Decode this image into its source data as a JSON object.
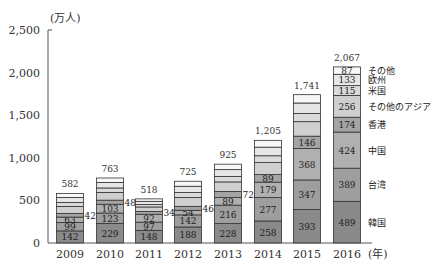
{
  "chart_data": {
    "type": "bar",
    "stacked": true,
    "title": "",
    "ylabel": "(万人)",
    "xlabel": "(年)",
    "ylim": [
      0,
      2500
    ],
    "yticks": [
      0,
      500,
      1000,
      1500,
      2000,
      2500
    ],
    "ytick_labels": [
      "0",
      "500",
      "1,000",
      "1,500",
      "2,000",
      "2,500"
    ],
    "categories": [
      "2009",
      "2010",
      "2011",
      "2012",
      "2013",
      "2014",
      "2015",
      "2016"
    ],
    "totals": [
      582,
      763,
      518,
      725,
      925,
      1205,
      1741,
      2067
    ],
    "total_labels": [
      "582",
      "763",
      "518",
      "725",
      "925",
      "1,205",
      "1,741",
      "2,067"
    ],
    "series": [
      {
        "name": "韓国",
        "color": "#8a8a8a",
        "values": [
          142,
          229,
          148,
          188,
          228,
          258,
          393,
          489
        ],
        "labeled": [
          true,
          true,
          true,
          true,
          true,
          true,
          true,
          true
        ]
      },
      {
        "name": "台湾",
        "color": "#9e9e9e",
        "values": [
          99,
          123,
          97,
          142,
          216,
          277,
          347,
          389
        ],
        "labeled": [
          true,
          true,
          true,
          true,
          true,
          true,
          true,
          true
        ]
      },
      {
        "name": "中国",
        "color": "#b0b0b0",
        "values": [
          63,
          103,
          92,
          54,
          89,
          179,
          368,
          424
        ],
        "labeled": [
          true,
          true,
          true,
          true,
          true,
          true,
          true,
          true
        ]
      },
      {
        "name": "香港",
        "color": "#a4a4a4",
        "values": [
          42,
          48,
          34,
          46,
          72,
          89,
          146,
          174
        ],
        "labeled": [
          false,
          false,
          false,
          false,
          false,
          true,
          true,
          true
        ],
        "side_label": [
          true,
          true,
          true,
          true,
          true,
          false,
          false,
          false
        ]
      },
      {
        "name": "その他のアジア",
        "color": "#cfcfcf",
        "values": [
          83,
          91,
          52,
          103,
          112,
          141,
          170,
          256
        ],
        "labeled": [
          false,
          false,
          false,
          false,
          false,
          false,
          false,
          true
        ]
      },
      {
        "name": "米国",
        "color": "#dadada",
        "values": [
          47,
          52,
          29,
          59,
          64,
          80,
          97,
          115
        ],
        "labeled": [
          false,
          false,
          false,
          false,
          false,
          false,
          false,
          true
        ]
      },
      {
        "name": "欧州",
        "color": "#e6e6e6",
        "values": [
          59,
          65,
          37,
          74,
          80,
          101,
          122,
          133
        ],
        "labeled": [
          false,
          false,
          false,
          false,
          false,
          false,
          false,
          true
        ]
      },
      {
        "name": "その他",
        "color": "#f7f7f7",
        "values": [
          47,
          52,
          29,
          59,
          64,
          80,
          98,
          87
        ],
        "labeled": [
          false,
          false,
          false,
          false,
          false,
          false,
          false,
          true
        ]
      }
    ],
    "legend_position": "right-of-last-bar",
    "grid": false
  }
}
